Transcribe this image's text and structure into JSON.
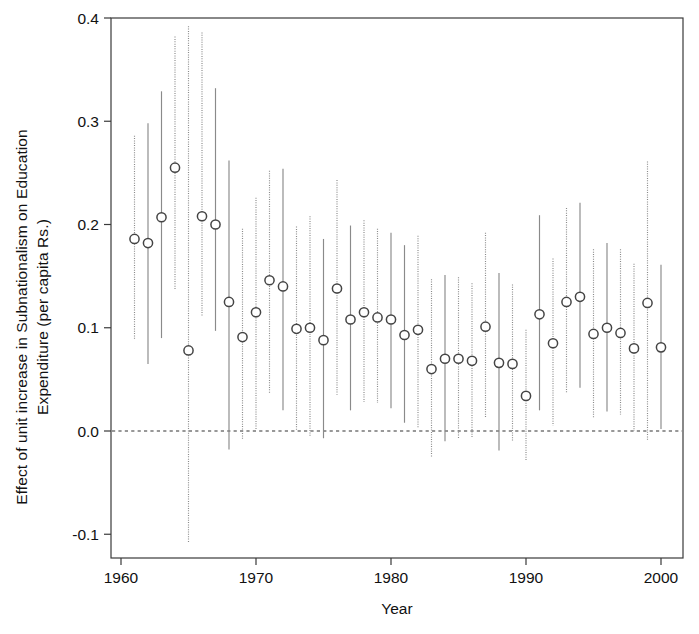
{
  "chart_data": {
    "type": "scatter",
    "title": "",
    "xlabel": "Year",
    "ylabel": "Effect of unit increase in Subnationalism on Education\nExpenditure (per capita Rs.)",
    "xlim": [
      1959.3,
      2001.6
    ],
    "ylim": [
      -0.13,
      0.4
    ],
    "xticks": [
      1960,
      1970,
      1980,
      1990,
      2000
    ],
    "xtick_labels": [
      "1960",
      "1970",
      "1980",
      "1990",
      "2000"
    ],
    "yticks": [
      -0.1,
      0.0,
      0.1,
      0.2,
      0.3,
      0.4
    ],
    "ytick_labels": [
      "-0.1",
      "0.0",
      "0.1",
      "0.2",
      "0.3",
      "0.4"
    ],
    "grid": false,
    "legend": null,
    "reference_lines": [
      {
        "y": 0.0,
        "style": "dashed",
        "color": "#333333"
      }
    ],
    "marker": "open-circle",
    "error_bar_note": "vertical confidence intervals; alternating solid and dotted line styles",
    "x": [
      1961,
      1962,
      1963,
      1964,
      1965,
      1966,
      1967,
      1968,
      1969,
      1970,
      1971,
      1972,
      1973,
      1974,
      1975,
      1976,
      1977,
      1978,
      1979,
      1980,
      1981,
      1982,
      1983,
      1984,
      1985,
      1986,
      1987,
      1988,
      1989,
      1990,
      1991,
      1992,
      1993,
      1994,
      1995,
      1996,
      1997,
      1998,
      1999,
      2000
    ],
    "values": [
      0.186,
      0.182,
      0.207,
      0.255,
      0.078,
      0.208,
      0.2,
      0.125,
      0.091,
      0.115,
      0.146,
      0.14,
      0.099,
      0.1,
      0.088,
      0.138,
      0.108,
      0.115,
      0.11,
      0.108,
      0.093,
      0.098,
      0.06,
      0.07,
      0.07,
      0.068,
      0.101,
      0.066,
      0.065,
      0.034,
      0.113,
      0.085,
      0.125,
      0.13,
      0.094,
      0.1,
      0.095,
      0.08,
      0.124,
      0.081
    ],
    "ci_low": [
      0.088,
      0.065,
      0.09,
      0.136,
      -0.108,
      0.111,
      0.097,
      -0.018,
      -0.009,
      0.002,
      0.037,
      0.02,
      0.001,
      -0.005,
      -0.007,
      0.035,
      0.02,
      0.028,
      0.027,
      0.022,
      0.008,
      0.003,
      -0.025,
      -0.01,
      -0.008,
      -0.006,
      0.013,
      -0.019,
      -0.01,
      -0.028,
      0.02,
      0.005,
      0.036,
      0.042,
      0.013,
      0.019,
      0.016,
      0.0,
      -0.01,
      0.002
    ],
    "ci_high": [
      0.286,
      0.298,
      0.329,
      0.382,
      0.392,
      0.386,
      0.332,
      0.262,
      0.196,
      0.226,
      0.252,
      0.254,
      0.198,
      0.208,
      0.186,
      0.243,
      0.199,
      0.204,
      0.196,
      0.192,
      0.18,
      0.189,
      0.147,
      0.151,
      0.149,
      0.143,
      0.192,
      0.153,
      0.142,
      0.098,
      0.209,
      0.167,
      0.216,
      0.221,
      0.176,
      0.182,
      0.176,
      0.162,
      0.261,
      0.161
    ],
    "ci_style": [
      "dotted",
      "solid",
      "solid",
      "dotted",
      "dotted",
      "dotted",
      "solid",
      "solid",
      "dotted",
      "dotted",
      "dotted",
      "solid",
      "dotted",
      "dotted",
      "solid",
      "dotted",
      "solid",
      "dotted",
      "dotted",
      "solid",
      "solid",
      "dotted",
      "dotted",
      "solid",
      "dotted",
      "dotted",
      "dotted",
      "solid",
      "dotted",
      "dotted",
      "solid",
      "dotted",
      "dotted",
      "solid",
      "dotted",
      "solid",
      "dotted",
      "dotted",
      "dotted",
      "solid"
    ]
  },
  "colors": {
    "marker_stroke": "#444444",
    "marker_fill": "#ffffff",
    "error_bar": "#8a8a8a",
    "axis": "#3a3a3a",
    "reference_line": "#333333",
    "background": "#ffffff"
  }
}
